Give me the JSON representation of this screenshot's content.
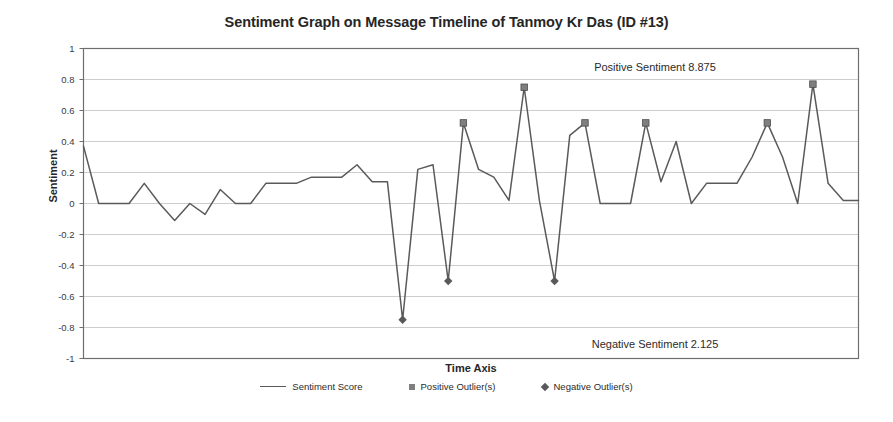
{
  "chart_data": {
    "type": "line",
    "title": "Sentiment Graph on Message Timeline of Tanmoy Kr Das (ID #13)",
    "xlabel": "Time Axis",
    "ylabel": "Sentiment",
    "ylim": [
      -1,
      1
    ],
    "yticks": [
      "1",
      "0.8",
      "0.6",
      "0.4",
      "0.2",
      "0",
      "-0.2",
      "-0.4",
      "-0.6",
      "-0.8",
      "-1"
    ],
    "ytick_values": [
      1,
      0.8,
      0.6,
      0.4,
      0.2,
      0,
      -0.2,
      -0.4,
      -0.6,
      -0.8,
      -1
    ],
    "xticks": [],
    "grid": "horizontal",
    "legend_position": "bottom",
    "series": [
      {
        "name": "Sentiment Score",
        "type": "line",
        "color": "#5a5a5a",
        "values": [
          0.37,
          0.0,
          0.0,
          0.0,
          0.13,
          0.0,
          -0.11,
          0.0,
          -0.07,
          0.09,
          0.0,
          0.0,
          0.13,
          0.13,
          0.13,
          0.17,
          0.17,
          0.17,
          0.25,
          0.14,
          0.14,
          -0.75,
          0.22,
          0.25,
          -0.5,
          0.52,
          0.22,
          0.17,
          0.02,
          0.75,
          0.02,
          -0.5,
          0.44,
          0.52,
          0.0,
          0.0,
          0.0,
          0.52,
          0.14,
          0.4,
          0.0,
          0.13,
          0.13,
          0.13,
          0.3,
          0.52,
          0.3,
          0.0,
          0.77,
          0.13,
          0.02,
          0.02
        ]
      },
      {
        "name": "Positive Outlier(s)",
        "type": "scatter",
        "marker": "square",
        "color": "#7f7f7f",
        "points": [
          {
            "index": 25,
            "value": 0.52
          },
          {
            "index": 29,
            "value": 0.75
          },
          {
            "index": 33,
            "value": 0.52
          },
          {
            "index": 37,
            "value": 0.52
          },
          {
            "index": 45,
            "value": 0.52
          },
          {
            "index": 48,
            "value": 0.77
          }
        ]
      },
      {
        "name": "Negative Outlier(s)",
        "type": "scatter",
        "marker": "diamond",
        "color": "#595959",
        "points": [
          {
            "index": 21,
            "value": -0.75
          },
          {
            "index": 24,
            "value": -0.5
          },
          {
            "index": 31,
            "value": -0.5
          }
        ]
      }
    ],
    "annotations": [
      {
        "name": "positive-sentiment-annotation",
        "text": "Positive Sentiment 8.875",
        "value": 0.875
      },
      {
        "name": "negative-sentiment-annotation",
        "text": "Negative Sentiment 2.125",
        "value": 2.125
      }
    ]
  },
  "legend": {
    "items": [
      {
        "label": "Sentiment Score",
        "marker": "line"
      },
      {
        "label": "Positive Outlier(s)",
        "marker": "square"
      },
      {
        "label": "Negative Outlier(s)",
        "marker": "diamond"
      }
    ]
  },
  "colors": {
    "line": "#5a5a5a",
    "positive_outlier": "#7f7f7f",
    "negative_outlier": "#595959",
    "grid": "#b8b8b8",
    "axis": "#6e6e6e",
    "text": "#262626"
  }
}
